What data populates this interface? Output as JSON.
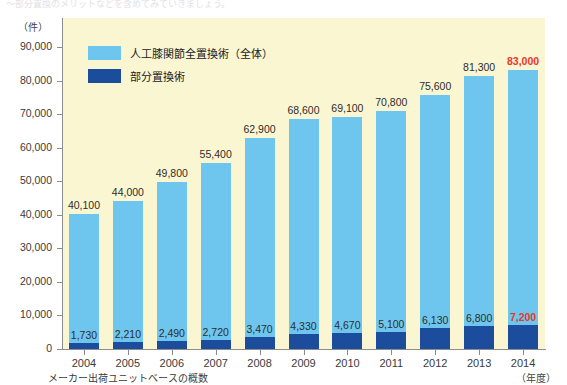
{
  "top_cut_text": "～部分置換のメリットなどを含めてみていきましょう。",
  "footnote": "メーカー出荷ユニットベースの概数",
  "legend": {
    "items": [
      {
        "label": "人工膝関節全置換術（全体）",
        "color": "#6ec6ee",
        "key": "total"
      },
      {
        "label": "部分置換術",
        "color": "#1c4c9c",
        "key": "partial"
      }
    ]
  },
  "axes": {
    "y_unit": "（件）",
    "x_unit": "（年度）",
    "y_ticks": [
      "0",
      "10,000",
      "20,000",
      "30,000",
      "40,000",
      "50,000",
      "60,000",
      "70,000",
      "80,000",
      "90,000"
    ],
    "y_tick_values": [
      0,
      10000,
      20000,
      30000,
      40000,
      50000,
      60000,
      70000,
      80000,
      90000
    ]
  },
  "colors": {
    "total_bar": "#6ec6ee",
    "partial_bar": "#1c4c9c",
    "plot_background": "#faf6d2",
    "highlight": "#e8372b",
    "axis": "#8d8d8d"
  },
  "chart_data": {
    "type": "bar",
    "title": "",
    "subtitle": "",
    "xlabel": "（年度）",
    "ylabel": "（件）",
    "ylim": [
      0,
      90000
    ],
    "grid": false,
    "legend_position": "inside-top-left",
    "stacked": true,
    "categories": [
      "2004",
      "2005",
      "2006",
      "2007",
      "2008",
      "2009",
      "2010",
      "2011",
      "2012",
      "2013",
      "2014"
    ],
    "series": [
      {
        "name": "人工膝関節全置換術（全体）",
        "color": "#6ec6ee",
        "values": [
          40100,
          44000,
          49800,
          55400,
          62900,
          68600,
          69100,
          70800,
          75600,
          81300,
          83000
        ],
        "labels": [
          "40,100",
          "44,000",
          "49,800",
          "55,400",
          "62,900",
          "68,600",
          "69,100",
          "70,800",
          "75,600",
          "81,300",
          "83,000"
        ],
        "highlight_index": 10
      },
      {
        "name": "部分置換術",
        "color": "#1c4c9c",
        "values": [
          1730,
          2210,
          2490,
          2720,
          3470,
          4330,
          4670,
          5100,
          6130,
          6800,
          7200
        ],
        "labels": [
          "1,730",
          "2,210",
          "2,490",
          "2,720",
          "3,470",
          "4,330",
          "4,670",
          "5,100",
          "6,130",
          "6,800",
          "7,200"
        ],
        "highlight_index": 10
      }
    ]
  }
}
